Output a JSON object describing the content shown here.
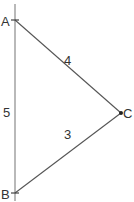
{
  "diagram": {
    "type": "triangle",
    "stroke_color": "#555555",
    "vertices": [
      {
        "id": "A",
        "label": "A",
        "x": 15,
        "y": 20
      },
      {
        "id": "B",
        "label": "B",
        "x": 15,
        "y": 193
      },
      {
        "id": "C",
        "label": "C",
        "x": 121,
        "y": 113
      }
    ],
    "edges": [
      {
        "from": "A",
        "to": "C",
        "label": "4"
      },
      {
        "from": "B",
        "to": "C",
        "label": "3"
      },
      {
        "from": "A",
        "to": "B",
        "label": "5"
      }
    ],
    "labels": {
      "A": "A",
      "B": "B",
      "C": "C",
      "AC": "4",
      "BC": "3",
      "AB": "5"
    }
  }
}
